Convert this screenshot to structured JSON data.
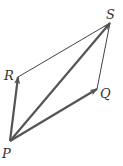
{
  "diagram": {
    "title": "",
    "type": "vector parallelogram",
    "points": {
      "P": {
        "label": "P",
        "x": 10,
        "y": 141,
        "lx": 2,
        "ly": 158
      },
      "R": {
        "label": "R",
        "x": 18,
        "y": 77,
        "lx": 4,
        "ly": 80
      },
      "Q": {
        "label": "Q",
        "x": 97,
        "y": 89,
        "lx": 100,
        "ly": 98
      },
      "S": {
        "label": "S",
        "x": 110,
        "y": 23,
        "lx": 106,
        "ly": 19
      }
    },
    "vectors": [
      {
        "from": "P",
        "to": "R",
        "style": "arrow"
      },
      {
        "from": "P",
        "to": "Q",
        "style": "arrow"
      },
      {
        "from": "P",
        "to": "S",
        "style": "arrow"
      }
    ],
    "segments": [
      {
        "from": "R",
        "to": "S",
        "style": "thin"
      },
      {
        "from": "Q",
        "to": "S",
        "style": "thin"
      }
    ],
    "colors": {
      "arrow": "#555555",
      "thin": "#444444",
      "label": "#333333"
    }
  }
}
